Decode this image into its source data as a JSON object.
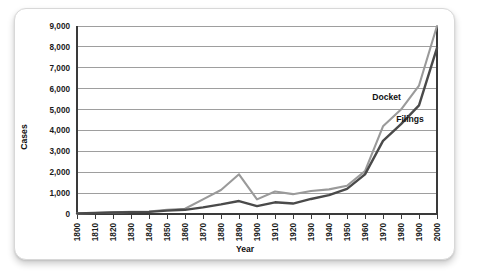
{
  "card": {
    "background": "#ffffff",
    "border_color": "#d8d8d8"
  },
  "chart_data": {
    "type": "line",
    "title": "",
    "subtitle": "",
    "xlabel": "Year",
    "ylabel": "Cases",
    "xlim": [
      1800,
      2000
    ],
    "ylim": [
      0,
      9000
    ],
    "grid": true,
    "legend_position": "inline-annotation",
    "x": [
      1800,
      1810,
      1820,
      1830,
      1840,
      1850,
      1860,
      1870,
      1880,
      1890,
      1900,
      1910,
      1920,
      1930,
      1940,
      1950,
      1960,
      1970,
      1980,
      1990,
      2000
    ],
    "xtick_labels": [
      "1800",
      "1810",
      "1820",
      "1830",
      "1840",
      "1850",
      "1860",
      "1870",
      "1880",
      "1890",
      "1900",
      "1910",
      "1920",
      "1930",
      "1940",
      "1950",
      "1960",
      "1970",
      "1980",
      "1900",
      "2000"
    ],
    "ytick_labels": [
      "0",
      "1,000",
      "2,000",
      "3,000",
      "4,000",
      "5,000",
      "6,000",
      "7,000",
      "8,000",
      "9,000"
    ],
    "ytick_values": [
      0,
      1000,
      2000,
      3000,
      4000,
      5000,
      6000,
      7000,
      8000,
      9000
    ],
    "series": [
      {
        "name": "Docket",
        "color": "#9a9a9a",
        "stroke_width": 2.1,
        "label_x": 1972,
        "label_y": 5450,
        "values": [
          30,
          50,
          80,
          100,
          120,
          200,
          250,
          700,
          1150,
          1900,
          700,
          1080,
          950,
          1100,
          1180,
          1350,
          2050,
          4200,
          5000,
          6150,
          9000
        ]
      },
      {
        "name": "Filings",
        "color": "#4a4a4a",
        "stroke_width": 2.4,
        "label_x": 1985,
        "label_y": 4400,
        "values": [
          30,
          50,
          70,
          90,
          100,
          160,
          200,
          320,
          460,
          620,
          380,
          560,
          500,
          720,
          900,
          1200,
          1900,
          3500,
          4300,
          5200,
          7950
        ]
      }
    ]
  }
}
